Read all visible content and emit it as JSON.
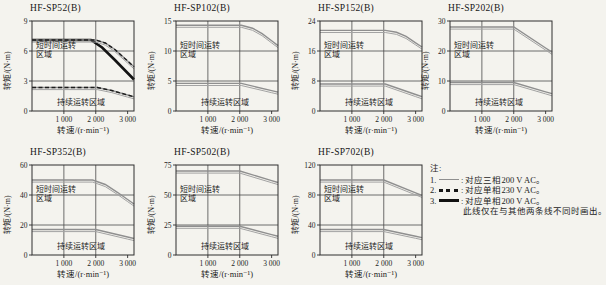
{
  "figure": {
    "background": "#f4f3ee"
  },
  "axis": {
    "xlabel": "转速/(r·min⁻¹)",
    "ylabel": "转矩/(N·m)",
    "xticks": [
      {
        "v": 1000,
        "label": "1 000"
      },
      {
        "v": 2000,
        "label": "2 000"
      },
      {
        "v": 3000,
        "label": "3 000"
      }
    ],
    "xlim": [
      0,
      3000
    ],
    "grid": true
  },
  "labels": {
    "short_time_line1": "短时间运转",
    "short_time_line2": "区域",
    "continuous": "持续运转区域"
  },
  "colors": {
    "gray_curve": "#8f8f8f",
    "gray_echo": "#a3a3a3",
    "black_curve": "#131313",
    "dashed_curve": "#1c1c1c",
    "grid": "#4a4a4a",
    "border": "#2e2e2e",
    "text": "#1d1d1d"
  },
  "notes": {
    "heading": "注:",
    "items": [
      {
        "num": "1.",
        "style": "solid-gray",
        "text": ": 对应三相200 V AC。"
      },
      {
        "num": "2.",
        "style": "dashed-black",
        "text": ": 对应单相230 V AC。"
      },
      {
        "num": "3.",
        "style": "thick-black",
        "text": ": 对应单相200 V AC。"
      }
    ],
    "footnote": "此线仅在与其他两条线不同时画出。"
  },
  "chart_data": [
    {
      "type": "line",
      "title": "HF-SP52(B)",
      "ylim": [
        0,
        9
      ],
      "yticks": [
        9,
        6,
        3,
        0
      ],
      "series": [
        {
          "name": "单相200 V AC",
          "region": "short-time",
          "style": "thick-black",
          "points": [
            [
              0,
              7.1
            ],
            [
              1850,
              7.1
            ],
            [
              2200,
              6.35
            ],
            [
              2600,
              5.1
            ],
            [
              3000,
              3.8
            ]
          ]
        },
        {
          "name": "三相200 V AC",
          "region": "short-time",
          "style": "solid-gray",
          "points": [
            [
              0,
              7.1
            ],
            [
              2000,
              7.1
            ],
            [
              2300,
              6.8
            ],
            [
              2600,
              6.15
            ],
            [
              3000,
              5.0
            ]
          ]
        },
        {
          "name": "单相230 V AC",
          "region": "short-time",
          "style": "dashed-black",
          "points": [
            [
              0,
              7.1
            ],
            [
              2000,
              7.1
            ],
            [
              2300,
              6.8
            ],
            [
              2600,
              6.15
            ],
            [
              3000,
              5.0
            ]
          ]
        },
        {
          "name": "三相200 V AC",
          "region": "continuous",
          "style": "solid-gray",
          "points": [
            [
              0,
              2.35
            ],
            [
              2050,
              2.35
            ],
            [
              2500,
              2.05
            ],
            [
              3000,
              1.6
            ]
          ]
        },
        {
          "name": "单相230 V AC",
          "region": "continuous",
          "style": "dashed-black",
          "points": [
            [
              0,
              2.35
            ],
            [
              2050,
              2.35
            ],
            [
              2500,
              2.05
            ],
            [
              3000,
              1.6
            ]
          ]
        }
      ]
    },
    {
      "type": "line",
      "title": "HF-SP102(B)",
      "ylim": [
        0,
        15
      ],
      "yticks": [
        15,
        10,
        5,
        0
      ],
      "series": [
        {
          "name": "三相200 V AC",
          "region": "short-time",
          "style": "solid-gray",
          "points": [
            [
              0,
              14.3
            ],
            [
              2050,
              14.3
            ],
            [
              2400,
              13.8
            ],
            [
              2700,
              12.9
            ],
            [
              3000,
              11.7
            ]
          ]
        },
        {
          "name": "三相200 V AC",
          "region": "continuous",
          "style": "solid-gray",
          "points": [
            [
              0,
              4.6
            ],
            [
              2050,
              4.6
            ],
            [
              3000,
              3.4
            ]
          ]
        }
      ]
    },
    {
      "type": "line",
      "title": "HF-SP152(B)",
      "ylim": [
        0,
        24
      ],
      "yticks": [
        24,
        16,
        8,
        0
      ],
      "series": [
        {
          "name": "三相200 V AC",
          "region": "short-time",
          "style": "solid-gray",
          "points": [
            [
              0,
              21.5
            ],
            [
              2050,
              21.5
            ],
            [
              2400,
              21.0
            ],
            [
              2700,
              19.9
            ],
            [
              3000,
              18.2
            ]
          ]
        },
        {
          "name": "三相200 V AC",
          "region": "continuous",
          "style": "solid-gray",
          "points": [
            [
              0,
              7.2
            ],
            [
              2050,
              7.2
            ],
            [
              3000,
              4.4
            ]
          ]
        }
      ]
    },
    {
      "type": "line",
      "title": "HF-SP202(B)",
      "ylim": [
        0,
        30
      ],
      "yticks": [
        30,
        20,
        10,
        0
      ],
      "series": [
        {
          "name": "三相200 V AC",
          "region": "short-time",
          "style": "solid-gray",
          "points": [
            [
              0,
              28
            ],
            [
              2000,
              28
            ],
            [
              3000,
              21
            ]
          ]
        },
        {
          "name": "三相200 V AC",
          "region": "continuous",
          "style": "solid-gray",
          "points": [
            [
              0,
              9.5
            ],
            [
              2000,
              9.5
            ],
            [
              3000,
              6.4
            ]
          ]
        }
      ]
    },
    {
      "type": "line",
      "title": "HF-SP352(B)",
      "ylim": [
        0,
        60
      ],
      "yticks": [
        60,
        40,
        20,
        0
      ],
      "series": [
        {
          "name": "三相200 V AC",
          "region": "short-time",
          "style": "solid-gray",
          "points": [
            [
              0,
              50
            ],
            [
              1900,
              50
            ],
            [
              2300,
              47
            ],
            [
              2700,
              41.5
            ],
            [
              3000,
              37
            ]
          ]
        },
        {
          "name": "三相200 V AC",
          "region": "continuous",
          "style": "solid-gray",
          "points": [
            [
              0,
              17
            ],
            [
              2000,
              17
            ],
            [
              3000,
              12
            ]
          ]
        }
      ]
    },
    {
      "type": "line",
      "title": "HF-SP502(B)",
      "ylim": [
        0,
        75
      ],
      "yticks": [
        75,
        50,
        25,
        0
      ],
      "series": [
        {
          "name": "三相200 V AC",
          "region": "short-time",
          "style": "solid-gray",
          "points": [
            [
              0,
              70
            ],
            [
              2000,
              70
            ],
            [
              3000,
              62
            ]
          ]
        },
        {
          "name": "三相200 V AC",
          "region": "continuous",
          "style": "solid-gray",
          "points": [
            [
              0,
              24
            ],
            [
              2000,
              24
            ],
            [
              3000,
              17
            ]
          ]
        }
      ]
    },
    {
      "type": "line",
      "title": "HF-SP702(B)",
      "ylim": [
        0,
        120
      ],
      "yticks": [
        120,
        80,
        40,
        0
      ],
      "series": [
        {
          "name": "三相200 V AC",
          "region": "short-time",
          "style": "solid-gray",
          "points": [
            [
              0,
              100
            ],
            [
              2000,
              100
            ],
            [
              3000,
              83
            ]
          ]
        },
        {
          "name": "三相200 V AC",
          "region": "continuous",
          "style": "solid-gray",
          "points": [
            [
              0,
              34
            ],
            [
              2000,
              34
            ],
            [
              3000,
              25
            ]
          ]
        }
      ]
    }
  ]
}
